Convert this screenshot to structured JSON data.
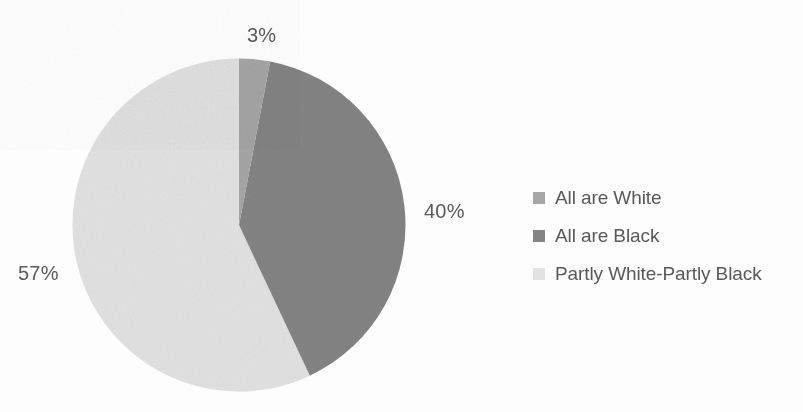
{
  "chart_data": {
    "type": "pie",
    "title": "",
    "subtitle": "",
    "xlabel": "",
    "ylabel": "",
    "grid": false,
    "legend_position": "right",
    "start_angle_deg": 0,
    "direction": "clockwise",
    "units": "percent",
    "categories": [
      "All are White",
      "All are Black",
      "Partly White-Partly Black"
    ],
    "values": [
      3,
      40,
      57
    ],
    "value_labels": [
      "3%",
      "40%",
      "57%"
    ],
    "colors": [
      "#a6a6a6",
      "#848484",
      "#e2e2e2"
    ],
    "slices": [
      {
        "label": "All are White",
        "value": 3,
        "value_label": "3%",
        "color": "#a6a6a6"
      },
      {
        "label": "All are Black",
        "value": 40,
        "value_label": "40%",
        "color": "#848484"
      },
      {
        "label": "Partly White-Partly Black",
        "value": 57,
        "value_label": "57%",
        "color": "#e2e2e2"
      }
    ]
  },
  "labels": {
    "white": "3%",
    "black": "40%",
    "partly": "57%"
  },
  "legend": {
    "items": [
      {
        "label": "All are White",
        "color": "#a6a6a6",
        "swatch_name": "legend-swatch-all-are-white"
      },
      {
        "label": "All are Black",
        "color": "#848484",
        "swatch_name": "legend-swatch-all-are-black"
      },
      {
        "label": "Partly White-Partly Black",
        "color": "#e2e2e2",
        "swatch_name": "legend-swatch-partly-white-partly-black"
      }
    ]
  },
  "style": {
    "background": "#fdfdfd",
    "text_color": "#595959"
  }
}
